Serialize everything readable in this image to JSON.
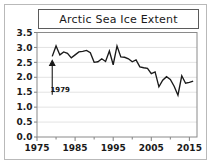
{
  "frame": {
    "border_color": "#b9b9b9",
    "background": "#ffffff"
  },
  "title": {
    "text": "Arctic Sea Ice Extent",
    "box_border_color": "#5b5b5b"
  },
  "annotation": {
    "label": "1979"
  },
  "chart_data": {
    "type": "line",
    "title": "Arctic Sea Ice Extent",
    "xlabel": "",
    "ylabel": "",
    "xlim": [
      1975,
      2017
    ],
    "ylim": [
      0.0,
      3.5
    ],
    "grid": true,
    "legend": "none",
    "line_color": "#1a1a1a",
    "ytick_labels": [
      "0.0",
      "0.5",
      "1.0",
      "1.5",
      "2.0",
      "2.5",
      "3.0",
      "3.5"
    ],
    "ytick_values": [
      0.0,
      0.5,
      1.0,
      1.5,
      2.0,
      2.5,
      3.0,
      3.5
    ],
    "xtick_labels": [
      "1975",
      "1985",
      "1995",
      "2005",
      "2015"
    ],
    "xtick_values": [
      1975,
      1985,
      1995,
      2005,
      2015
    ],
    "annotations": [
      {
        "text": "1979",
        "points_to_x": 1979,
        "points_to_y": 2.7,
        "label_y": 1.55
      }
    ],
    "series": [
      {
        "name": "Arctic Sea Ice Extent",
        "x": [
          1979,
          1980,
          1981,
          1982,
          1983,
          1984,
          1985,
          1986,
          1987,
          1988,
          1989,
          1990,
          1991,
          1992,
          1993,
          1994,
          1995,
          1996,
          1997,
          1998,
          1999,
          2000,
          2001,
          2002,
          2003,
          2004,
          2005,
          2006,
          2007,
          2008,
          2009,
          2010,
          2011,
          2012,
          2013,
          2014,
          2015,
          2016
        ],
        "values": [
          2.7,
          3.05,
          2.75,
          2.85,
          2.8,
          2.65,
          2.75,
          2.85,
          2.87,
          2.9,
          2.82,
          2.5,
          2.52,
          2.62,
          2.53,
          2.88,
          2.42,
          3.05,
          2.68,
          2.67,
          2.62,
          2.52,
          2.58,
          2.35,
          2.32,
          2.3,
          2.12,
          2.18,
          1.68,
          1.9,
          2.02,
          1.93,
          1.7,
          1.4,
          2.05,
          1.8,
          1.83,
          1.87
        ]
      }
    ]
  }
}
